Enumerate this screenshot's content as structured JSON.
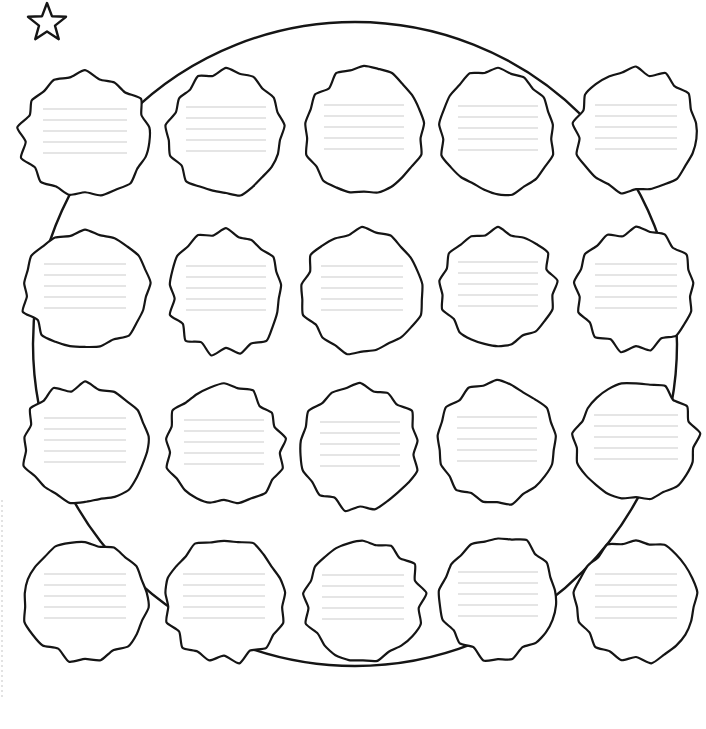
{
  "page": {
    "width": 706,
    "height": 729,
    "background_color": "#ffffff",
    "ink_color": "#151515",
    "rule_line_color": "#dcdcdc",
    "edge_guide_color": "#cfcfcf"
  },
  "decorations": {
    "star": {
      "name": "star-icon",
      "label": "star",
      "center_x": 47,
      "center_y": 23,
      "outer_radius": 20,
      "inner_radius": 8.4,
      "points": 5
    },
    "edge_guide": {
      "name": "left-edge-dashed-guide",
      "label": "left edge dashed guide",
      "x": 2,
      "y_start": 500,
      "y_end": 700
    }
  },
  "ellipse": {
    "name": "background-ellipse",
    "label": "background oval outline",
    "center_x": 355,
    "center_y": 344,
    "radius_x": 322,
    "radius_y": 322,
    "stroke_color": "#151515",
    "stroke_width": 2.4
  },
  "grid": {
    "rows": 4,
    "columns": 5,
    "total_blobs": 20,
    "rule_lines_per_blob": 5,
    "rule_line_spacing": 11,
    "row_centers_y": [
      135,
      290,
      444,
      600
    ],
    "column_centers_x": [
      85,
      225,
      364,
      497,
      635
    ],
    "blob_radius_x": 65,
    "blob_radius_y": 62
  },
  "blobs": [
    {
      "id": "blob-r1-c1",
      "row": 1,
      "col": 1,
      "cx": 85,
      "cy": 135,
      "rx": 64,
      "ry": 60,
      "seed": 11,
      "lines": 5,
      "line_width": 84
    },
    {
      "id": "blob-r1-c2",
      "row": 1,
      "col": 2,
      "cx": 226,
      "cy": 133,
      "rx": 56,
      "ry": 60,
      "seed": 23,
      "lines": 5,
      "line_width": 80
    },
    {
      "id": "blob-r1-c3",
      "row": 1,
      "col": 3,
      "cx": 364,
      "cy": 131,
      "rx": 57,
      "ry": 62,
      "seed": 37,
      "lines": 5,
      "line_width": 80
    },
    {
      "id": "blob-r1-c4",
      "row": 1,
      "col": 4,
      "cx": 498,
      "cy": 132,
      "rx": 56,
      "ry": 61,
      "seed": 49,
      "lines": 5,
      "line_width": 80
    },
    {
      "id": "blob-r1-c5",
      "row": 1,
      "col": 5,
      "cx": 636,
      "cy": 131,
      "rx": 59,
      "ry": 61,
      "seed": 61,
      "lines": 5,
      "line_width": 82
    },
    {
      "id": "blob-r2-c1",
      "row": 2,
      "col": 1,
      "cx": 85,
      "cy": 290,
      "rx": 62,
      "ry": 57,
      "seed": 73,
      "lines": 5,
      "line_width": 82
    },
    {
      "id": "blob-r2-c2",
      "row": 2,
      "col": 2,
      "cx": 226,
      "cy": 292,
      "rx": 56,
      "ry": 60,
      "seed": 85,
      "lines": 5,
      "line_width": 80
    },
    {
      "id": "blob-r2-c3",
      "row": 2,
      "col": 3,
      "cx": 362,
      "cy": 292,
      "rx": 59,
      "ry": 61,
      "seed": 97,
      "lines": 5,
      "line_width": 82
    },
    {
      "id": "blob-r2-c4",
      "row": 2,
      "col": 4,
      "cx": 498,
      "cy": 288,
      "rx": 56,
      "ry": 57,
      "seed": 109,
      "lines": 5,
      "line_width": 80
    },
    {
      "id": "blob-r2-c5",
      "row": 2,
      "col": 5,
      "cx": 636,
      "cy": 290,
      "rx": 58,
      "ry": 59,
      "seed": 121,
      "lines": 5,
      "line_width": 82
    },
    {
      "id": "blob-r3-c1",
      "row": 3,
      "col": 1,
      "cx": 85,
      "cy": 444,
      "rx": 62,
      "ry": 58,
      "seed": 133,
      "lines": 5,
      "line_width": 82
    },
    {
      "id": "blob-r3-c2",
      "row": 3,
      "col": 2,
      "cx": 224,
      "cy": 446,
      "rx": 58,
      "ry": 58,
      "seed": 145,
      "lines": 5,
      "line_width": 80
    },
    {
      "id": "blob-r3-c3",
      "row": 3,
      "col": 3,
      "cx": 360,
      "cy": 448,
      "rx": 58,
      "ry": 60,
      "seed": 157,
      "lines": 5,
      "line_width": 80
    },
    {
      "id": "blob-r3-c4",
      "row": 3,
      "col": 4,
      "cx": 497,
      "cy": 443,
      "rx": 57,
      "ry": 58,
      "seed": 169,
      "lines": 5,
      "line_width": 80
    },
    {
      "id": "blob-r3-c5",
      "row": 3,
      "col": 5,
      "cx": 636,
      "cy": 441,
      "rx": 60,
      "ry": 59,
      "seed": 181,
      "lines": 5,
      "line_width": 84
    },
    {
      "id": "blob-r4-c1",
      "row": 4,
      "col": 1,
      "cx": 85,
      "cy": 600,
      "rx": 62,
      "ry": 59,
      "seed": 193,
      "lines": 5,
      "line_width": 82
    },
    {
      "id": "blob-r4-c2",
      "row": 4,
      "col": 2,
      "cx": 224,
      "cy": 600,
      "rx": 59,
      "ry": 60,
      "seed": 205,
      "lines": 5,
      "line_width": 82
    },
    {
      "id": "blob-r4-c3",
      "row": 4,
      "col": 3,
      "cx": 363,
      "cy": 601,
      "rx": 59,
      "ry": 61,
      "seed": 217,
      "lines": 5,
      "line_width": 82
    },
    {
      "id": "blob-r4-c4",
      "row": 4,
      "col": 4,
      "cx": 498,
      "cy": 598,
      "rx": 57,
      "ry": 60,
      "seed": 229,
      "lines": 5,
      "line_width": 80
    },
    {
      "id": "blob-r4-c5",
      "row": 4,
      "col": 5,
      "cx": 636,
      "cy": 600,
      "rx": 59,
      "ry": 60,
      "seed": 241,
      "lines": 5,
      "line_width": 82
    }
  ]
}
